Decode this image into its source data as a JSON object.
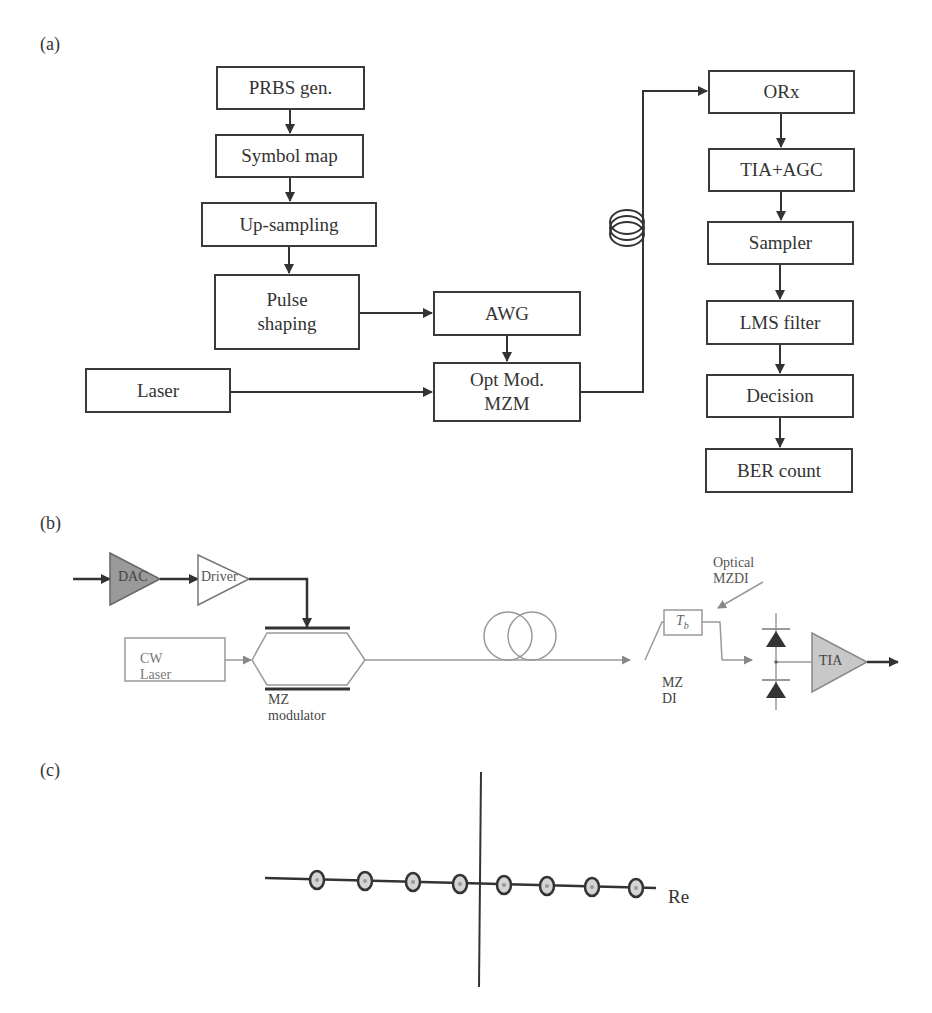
{
  "figure": {
    "panels": [
      {
        "id": "a",
        "label": "(a)",
        "transmitter_blocks": [
          {
            "id": "prbs",
            "label": "PRBS gen."
          },
          {
            "id": "symbol_map",
            "label": "Symbol map"
          },
          {
            "id": "upsampling",
            "label": "Up-sampling"
          },
          {
            "id": "pulse_shaping",
            "label": "Pulse\nshaping",
            "line1": "Pulse",
            "line2": "shaping"
          },
          {
            "id": "awg",
            "label": "AWG"
          },
          {
            "id": "opt_mod",
            "label": "Opt Mod.\nMZM",
            "line1": "Opt Mod.",
            "line2": "MZM"
          },
          {
            "id": "laser",
            "label": "Laser"
          }
        ],
        "receiver_blocks": [
          {
            "id": "orx",
            "label": "ORx"
          },
          {
            "id": "tia_agc",
            "label": "TIA+AGC"
          },
          {
            "id": "sampler",
            "label": "Sampler"
          },
          {
            "id": "lms",
            "label": "LMS filter"
          },
          {
            "id": "decision",
            "label": "Decision"
          },
          {
            "id": "ber",
            "label": "BER count"
          }
        ],
        "icons": [
          "fiber-coil-icon"
        ]
      },
      {
        "id": "b",
        "label": "(b)",
        "components": {
          "dac": "DAC",
          "driver": "Driver",
          "cw_laser": "CW Laser",
          "mz_modulator": "MZ modulator",
          "delay": "T",
          "delay_sub": "b",
          "mz_di": "MZ DI",
          "optical_mzdi": "Optical MZDI",
          "tia": "TIA"
        },
        "colors": {
          "dac_fill": "#9a9a9a",
          "tia_fill": "#c8c8c8",
          "optical_line": "#8a8a8a",
          "electrical_line": "#333333"
        }
      },
      {
        "id": "c",
        "label": "(c)",
        "axis_label": "Re",
        "constellation_points": 8
      }
    ]
  }
}
